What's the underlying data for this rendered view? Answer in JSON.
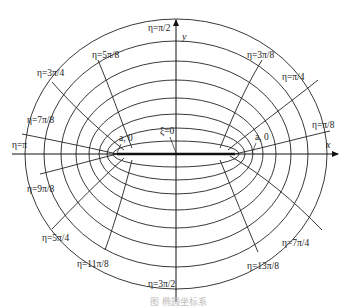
{
  "figure": {
    "type": "elliptic-coordinate-system",
    "axes": {
      "x_label": "x",
      "y_label": "y"
    },
    "center": [
      176,
      154
    ],
    "focal_half_distance_px": 59,
    "xi_curves": {
      "description": "confocal ellipses (xi = const)",
      "semi_axes": [
        [
          151,
          135
        ],
        [
          132,
          113
        ],
        [
          115,
          93
        ],
        [
          100,
          74
        ],
        [
          87,
          56
        ],
        [
          77,
          40
        ],
        [
          69,
          26
        ],
        [
          63,
          13
        ]
      ],
      "degenerate_label": "ξ=0"
    },
    "focus_labels": {
      "left": "a, 0",
      "right": "a, 0"
    },
    "eta_labels": [
      {
        "text": "η=π/2",
        "x": 148,
        "y": 31
      },
      {
        "text": "η=5π/8",
        "x": 92,
        "y": 58
      },
      {
        "text": "η=3π/8",
        "x": 247,
        "y": 58
      },
      {
        "text": "η=3π/4",
        "x": 37,
        "y": 76
      },
      {
        "text": "η=π/4",
        "x": 282,
        "y": 80
      },
      {
        "text": "η=7π/8",
        "x": 27,
        "y": 123
      },
      {
        "text": "η=π/8",
        "x": 312,
        "y": 128
      },
      {
        "text": "η=π",
        "x": 12,
        "y": 148
      },
      {
        "text": "η=9π/8",
        "x": 27,
        "y": 192
      },
      {
        "text": "η=7π/4",
        "x": 282,
        "y": 246
      },
      {
        "text": "η=5π/4",
        "x": 42,
        "y": 241
      },
      {
        "text": "η=13π/8",
        "x": 247,
        "y": 269
      },
      {
        "text": "η=11π/8",
        "x": 77,
        "y": 267
      },
      {
        "text": "η=3π/2",
        "x": 148,
        "y": 287
      }
    ],
    "caption": "图 椭圆坐标系"
  }
}
